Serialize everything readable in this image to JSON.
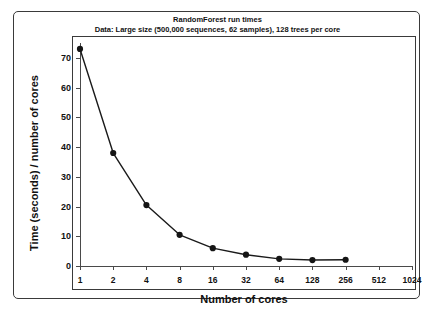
{
  "chart_data": {
    "type": "line",
    "title": "RandomForest run times",
    "subtitle": "Data: Large size (500,000 sequences, 62 samples), 128 trees per core",
    "xlabel": "Number of cores",
    "ylabel": "Time (seconds) / number of cores",
    "x_scale": "log2",
    "x_tick_labels": [
      "1",
      "2",
      "4",
      "8",
      "16",
      "32",
      "64",
      "128",
      "256",
      "512",
      "1024"
    ],
    "x_tick_values": [
      1,
      2,
      4,
      8,
      16,
      32,
      64,
      128,
      256,
      512,
      1024
    ],
    "y_tick_labels": [
      "0",
      "10",
      "20",
      "30",
      "40",
      "50",
      "60",
      "70"
    ],
    "y_tick_values": [
      0,
      10,
      20,
      30,
      40,
      50,
      60,
      70
    ],
    "ylim": [
      0,
      75
    ],
    "xlim": [
      1,
      1024
    ],
    "grid": false,
    "legend": false,
    "marker": "filled-circle",
    "line_color": "#1a1a1a",
    "marker_color": "#151515",
    "series": [
      {
        "name": "RandomForest run time",
        "x": [
          1,
          2,
          4,
          8,
          16,
          32,
          64,
          128,
          256
        ],
        "values": [
          73,
          38,
          20.5,
          10.5,
          6.0,
          3.8,
          2.4,
          2.0,
          2.1
        ]
      }
    ]
  }
}
